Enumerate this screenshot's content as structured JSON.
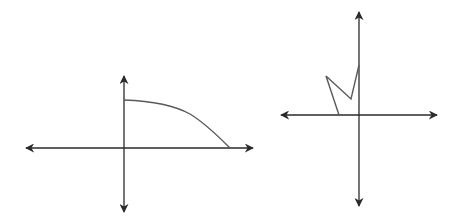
{
  "colors": {
    "background": "#ffffff",
    "axis": "#2a2a2a",
    "curve": "#5a5a5a"
  },
  "graphs": [
    {
      "name": "left-graph",
      "description": "Coordinate axes with a decreasing concave-down curve in the first quadrant, from the positive y-axis to the positive x-axis",
      "origin": [
        124,
        148
      ],
      "x_axis": {
        "from": [
          26,
          148
        ],
        "to": [
          253,
          148
        ]
      },
      "y_axis": {
        "from": [
          124,
          76
        ],
        "to": [
          124,
          212
        ]
      },
      "curve_path": "M124,100 C150,101 172,104 190,114 C205,123 218,136 230,148"
    },
    {
      "name": "right-graph",
      "description": "Coordinate axes with a zig-zag polyline in the second quadrant ending on the positive y-axis",
      "origin": [
        359,
        115
      ],
      "x_axis": {
        "from": [
          281,
          115
        ],
        "to": [
          437,
          115
        ]
      },
      "y_axis": {
        "from": [
          359,
          12
        ],
        "to": [
          359,
          206
        ]
      },
      "polyline_points": "339,115 326,76 351,99 359,65"
    }
  ]
}
